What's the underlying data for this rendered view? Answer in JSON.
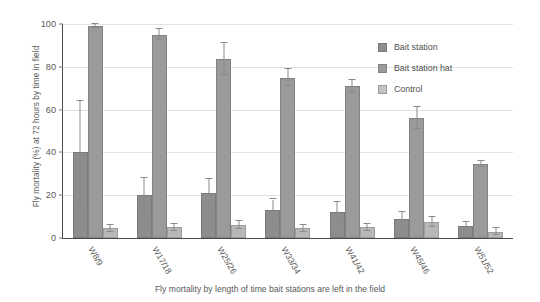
{
  "chart_data": {
    "type": "bar",
    "title": "",
    "xlabel": "Fly mortality by length of time bait stations are left in the field",
    "ylabel": "Fly mortality (%) at 72 hours by time in field",
    "ylim": [
      0,
      100
    ],
    "yticks": [
      0,
      20,
      40,
      60,
      80,
      100
    ],
    "grid": true,
    "legend_position": "upper right",
    "categories": [
      "W8/9",
      "W17/18",
      "W25/26",
      "W33/34",
      "W41/42",
      "W45/46",
      "W51/52"
    ],
    "series": [
      {
        "name": "Bait station",
        "color": "#8d8d8d",
        "values": [
          40.0,
          20.0,
          21.0,
          13.0,
          12.0,
          9.0,
          5.5
        ],
        "errors": [
          24.0,
          8.0,
          6.5,
          5.0,
          5.0,
          3.0,
          2.0
        ]
      },
      {
        "name": "Bait station hat",
        "color": "#9a9a9a",
        "values": [
          99.0,
          95.0,
          83.5,
          75.0,
          71.0,
          56.0,
          34.5
        ],
        "errors": [
          1.0,
          2.5,
          7.5,
          4.0,
          3.0,
          5.0,
          1.5
        ]
      },
      {
        "name": "Control",
        "color": "#c2c2c2",
        "values": [
          4.5,
          5.0,
          6.0,
          4.5,
          5.0,
          7.5,
          3.0
        ],
        "errors": [
          1.5,
          1.5,
          2.0,
          1.5,
          1.5,
          2.5,
          1.5
        ]
      }
    ]
  },
  "legend": {
    "items": [
      {
        "label": "Bait station"
      },
      {
        "label": "Bait station hat"
      },
      {
        "label": "Control"
      }
    ]
  }
}
